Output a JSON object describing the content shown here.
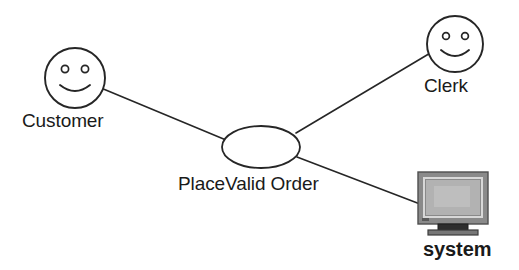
{
  "diagram": {
    "type": "uml-use-case-diagram",
    "background_color": "#ffffff",
    "stroke_color": "#262626",
    "text_color": "#1a1a1a",
    "actors": [
      {
        "id": "customer",
        "label": "Customer",
        "icon": "smiley-face-actor-icon",
        "cx": 75,
        "cy": 78,
        "r": 30
      },
      {
        "id": "clerk",
        "label": "Clerk",
        "icon": "smiley-face-actor-icon",
        "cx": 455,
        "cy": 44,
        "r": 28
      }
    ],
    "use_cases": [
      {
        "id": "place-valid-order",
        "label": "PlaceValid Order",
        "cx": 261,
        "cy": 147,
        "rx": 39,
        "ry": 21
      }
    ],
    "systems": [
      {
        "id": "system",
        "label": "system",
        "icon": "computer-monitor-icon",
        "x": 418,
        "y": 172,
        "width": 70,
        "height": 58,
        "colors": {
          "bezel": "#8a8a8a",
          "bezel_edge": "#5c5c5c",
          "screen": "#b0b0b0",
          "screen_border": "#d6d6d6",
          "stand": "#3d3d3d",
          "base": "#6e6e6e"
        }
      }
    ],
    "associations": [
      {
        "id": "customer-to-usecase",
        "from": "customer",
        "to": "place-valid-order",
        "x1": 101,
        "y1": 88,
        "x2": 226,
        "y2": 140
      },
      {
        "id": "clerk-to-usecase",
        "from": "clerk",
        "to": "place-valid-order",
        "x1": 296,
        "y1": 133,
        "x2": 432,
        "y2": 52
      },
      {
        "id": "usecase-to-system",
        "from": "place-valid-order",
        "to": "system",
        "x1": 297,
        "y1": 157,
        "x2": 420,
        "y2": 204
      }
    ]
  }
}
